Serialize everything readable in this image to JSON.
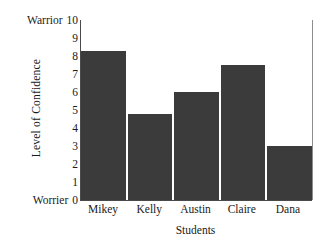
{
  "chart_data": {
    "type": "bar",
    "title": "",
    "categories": [
      "Mikey",
      "Kelly",
      "Austin",
      "Claire",
      "Dana"
    ],
    "values": [
      8.3,
      4.8,
      6.0,
      7.5,
      3.0
    ],
    "xlabel": "Students",
    "ylabel": "Level of Confidence",
    "ylim": [
      0,
      10
    ],
    "ytick_values": [
      10,
      9,
      8,
      7,
      6,
      5,
      4,
      3,
      2,
      1,
      0
    ],
    "ytick_labels": [
      "10",
      "9",
      "8",
      "7",
      "6",
      "5",
      "4",
      "3",
      "2",
      "1",
      "0"
    ],
    "ytick_prefixes": [
      "Warrior",
      "",
      "",
      "",
      "",
      "",
      "",
      "",
      "",
      "",
      "Worrier"
    ],
    "grid": false,
    "legend": null,
    "bar_color": "#3b3b3b",
    "axis_color": "#4a4a4a",
    "background_color": "#ffffff"
  },
  "axes": {
    "y_title": "Level of Confidence",
    "x_title": "Students",
    "y_top_anchor_label": "Warrior",
    "y_bottom_anchor_label": "Worrier"
  },
  "y_ticks": [
    {
      "prefix": "Warrior",
      "label": "10",
      "value": 10
    },
    {
      "prefix": "",
      "label": "9",
      "value": 9
    },
    {
      "prefix": "",
      "label": "8",
      "value": 8
    },
    {
      "prefix": "",
      "label": "7",
      "value": 7
    },
    {
      "prefix": "",
      "label": "6",
      "value": 6
    },
    {
      "prefix": "",
      "label": "5",
      "value": 5
    },
    {
      "prefix": "",
      "label": "4",
      "value": 4
    },
    {
      "prefix": "",
      "label": "3",
      "value": 3
    },
    {
      "prefix": "",
      "label": "2",
      "value": 2
    },
    {
      "prefix": "",
      "label": "1",
      "value": 1
    },
    {
      "prefix": "Worrier",
      "label": "0",
      "value": 0
    }
  ],
  "bars": [
    {
      "label": "Mikey",
      "value": 8.3
    },
    {
      "label": "Kelly",
      "value": 4.8
    },
    {
      "label": "Austin",
      "value": 6.0
    },
    {
      "label": "Claire",
      "value": 7.5
    },
    {
      "label": "Dana",
      "value": 3.0
    }
  ]
}
